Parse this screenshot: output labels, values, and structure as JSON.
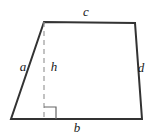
{
  "figure": {
    "name": "trapezoid-with-height",
    "background_color": "#ffffff",
    "stroke_color": "#333333",
    "dash_color": "#9a9a9a",
    "label_color": "#1a1a1a",
    "stroke_width": 2,
    "dash_width": 1.2,
    "canvas": {
      "width": 155,
      "height": 138
    },
    "vertices": {
      "top_left": {
        "x": 44,
        "y": 22
      },
      "top_right": {
        "x": 135,
        "y": 23
      },
      "bottom_right": {
        "x": 142,
        "y": 119
      },
      "bottom_left": {
        "x": 11,
        "y": 119
      }
    },
    "height_segment": {
      "from": {
        "x": 44,
        "y": 22
      },
      "to": {
        "x": 44,
        "y": 119
      },
      "dash_pattern": "5,4"
    },
    "right_angle_marker": {
      "x": 44,
      "y": 107,
      "size": 12
    },
    "labels": {
      "top_side": {
        "text": "c",
        "x": 86,
        "y": 13
      },
      "left_side": {
        "text": "a",
        "x": 23,
        "y": 68
      },
      "height": {
        "text": "h",
        "x": 54,
        "y": 68
      },
      "right_side": {
        "text": "d",
        "x": 141,
        "y": 69
      },
      "bottom_side": {
        "text": "b",
        "x": 77,
        "y": 129
      }
    }
  }
}
